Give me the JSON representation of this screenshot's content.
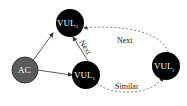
{
  "diagram": {
    "nodes": [
      {
        "id": "ac",
        "label": "AC",
        "sub": "",
        "fill": "#5a5a5a"
      },
      {
        "id": "vul2",
        "label": "VUL",
        "sub": "2",
        "fill": "#000000"
      },
      {
        "id": "vul1",
        "label": "VUL",
        "sub": "1",
        "fill": "#000000"
      },
      {
        "id": "vulj",
        "label": "VUL",
        "sub": "j",
        "fill": "#000000"
      }
    ],
    "edges": [
      {
        "from": "ac",
        "to": "vul2",
        "label": "",
        "style": "solid"
      },
      {
        "from": "ac",
        "to": "vul1",
        "label": "",
        "style": "solid"
      },
      {
        "from": "vul1",
        "to": "vul2",
        "label": "Next",
        "style": "solid"
      },
      {
        "from": "vulj",
        "to": "vul2",
        "label": "Next",
        "style": "dashed"
      },
      {
        "from": "vul1",
        "to": "vulj",
        "label": "Similar",
        "style": "dashed"
      }
    ]
  }
}
